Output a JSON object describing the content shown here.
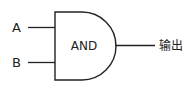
{
  "diagram": {
    "type": "logic-gate",
    "gate": {
      "label": "AND",
      "kind": "and-gate"
    },
    "inputs": [
      {
        "label": "A"
      },
      {
        "label": "B"
      }
    ],
    "output": {
      "label": "输出"
    },
    "colors": {
      "stroke": "#222222",
      "background": "#ffffff"
    }
  }
}
